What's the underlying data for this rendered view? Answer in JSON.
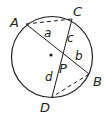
{
  "diagram": {
    "type": "intersecting-chords-in-circle",
    "points": {
      "A": "A",
      "B": "B",
      "C": "C",
      "D": "D",
      "P": "P"
    },
    "segments": {
      "a": "a",
      "b": "b",
      "c": "c",
      "d": "d"
    },
    "colors": {
      "stroke": "#231f20",
      "background": "#ffffff"
    }
  }
}
